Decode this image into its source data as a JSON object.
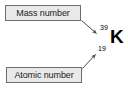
{
  "diagram": {
    "background_color": "#ffffff",
    "labels": {
      "mass_number": "Mass number",
      "atomic_number": "Atomic number"
    },
    "isotope": {
      "mass_number": "39",
      "atomic_number": "19",
      "element_symbol": "K"
    },
    "colors": {
      "box_fill": "#e9e9e9",
      "box_border": "#6d6d6d",
      "text": "#1a1a1a",
      "arrow": "#4a4a4a"
    },
    "annotations": {
      "mass_arrow": "arrow pointing from Mass number box down-right to superscript 39",
      "atomic_arrow": "arrow pointing from Atomic number box up-right to subscript 19"
    }
  }
}
